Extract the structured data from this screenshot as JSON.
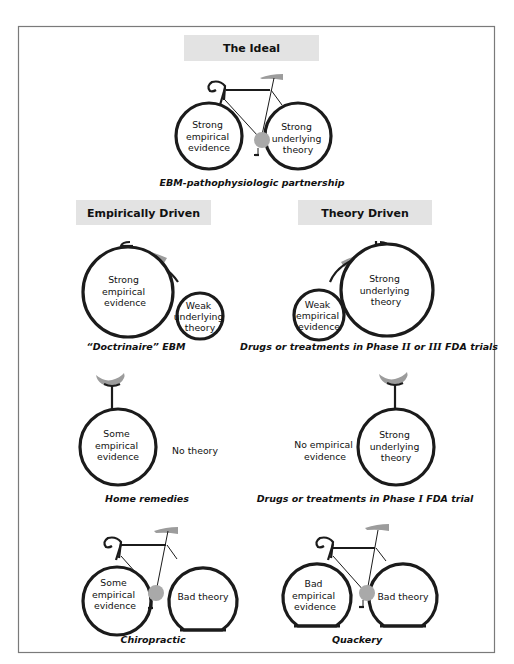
{
  "figure": {
    "sections": {
      "ideal": {
        "header": "The Ideal",
        "wheel_left": [
          "Strong",
          "empirical",
          "evidence"
        ],
        "wheel_right": [
          "Strong",
          "underlying",
          "theory"
        ],
        "caption": "EBM-pathophysiologic partnership"
      },
      "empirically_driven": {
        "header": "Empirically Driven",
        "wheel_big": [
          "Strong",
          "empirical",
          "evidence"
        ],
        "wheel_small": [
          "Weak",
          "underlying",
          "theory"
        ],
        "caption": "“Doctrinaire” EBM"
      },
      "theory_driven": {
        "header": "Theory Driven",
        "wheel_small": [
          "Weak",
          "empirical",
          "evidence"
        ],
        "wheel_big": [
          "Strong",
          "underlying",
          "theory"
        ],
        "caption_pre": "Drugs or treatments in Phase ",
        "caption_num1": "II",
        "caption_mid": " or ",
        "caption_num2": "III",
        "caption_post": " FDA trials"
      },
      "home_remedies": {
        "wheel": [
          "Some",
          "empirical",
          "evidence"
        ],
        "side_label": "No theory",
        "caption": "Home remedies"
      },
      "phase_one": {
        "side_label": [
          "No empirical",
          "evidence"
        ],
        "wheel": [
          "Strong",
          "underlying",
          "theory"
        ],
        "caption_pre": "Drugs or treatments in Phase ",
        "caption_num": "I",
        "caption_post": " FDA trial"
      },
      "chiropractic": {
        "wheel_left": [
          "Some",
          "empirical",
          "evidence"
        ],
        "wheel_right": "Bad theory",
        "caption": "Chiropractic"
      },
      "quackery": {
        "wheel_left": [
          "Bad",
          "empirical",
          "evidence"
        ],
        "wheel_right": "Bad theory",
        "caption": "Quackery"
      }
    },
    "colors": {
      "header_bg": "#e3e3e3",
      "wheel_stroke": "#1b1b1b",
      "crank": "#a9a9a9",
      "saddle": "#9c9c9c",
      "frame_border": "#7a7a7a"
    }
  }
}
